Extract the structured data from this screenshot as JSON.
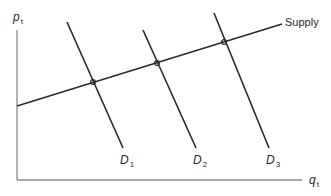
{
  "diagram": {
    "type": "supply-demand",
    "axes": {
      "y_label": "p",
      "y_sub": "t",
      "x_label": "q",
      "x_sub": "t"
    },
    "supply": {
      "label": "Supply"
    },
    "demand": [
      {
        "label": "D",
        "sub": "1"
      },
      {
        "label": "D",
        "sub": "2"
      },
      {
        "label": "D",
        "sub": "3"
      }
    ],
    "colors": {
      "line": "#2a2a2a",
      "axis": "#888888",
      "text": "#2a2a2a"
    }
  }
}
